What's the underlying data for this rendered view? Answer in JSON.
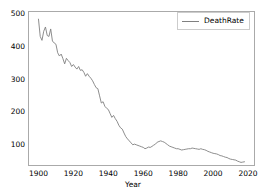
{
  "chart_data": {
    "type": "line",
    "title": "",
    "xlabel": "Year",
    "ylabel": "",
    "xlim": [
      1894,
      2024
    ],
    "ylim": [
      35,
      510
    ],
    "grid": false,
    "legend_position": "upper right",
    "xticks": [
      1900,
      1920,
      1940,
      1960,
      1980,
      2000,
      2020
    ],
    "yticks": [
      100,
      200,
      300,
      400,
      500
    ],
    "series": [
      {
        "name": "DeathRate",
        "color": "#808080",
        "x": [
          1900,
          1901,
          1902,
          1903,
          1904,
          1905,
          1906,
          1907,
          1908,
          1909,
          1910,
          1911,
          1912,
          1913,
          1914,
          1915,
          1916,
          1917,
          1918,
          1919,
          1920,
          1921,
          1922,
          1923,
          1924,
          1925,
          1926,
          1927,
          1928,
          1929,
          1930,
          1931,
          1932,
          1933,
          1934,
          1935,
          1936,
          1937,
          1938,
          1939,
          1940,
          1941,
          1942,
          1943,
          1944,
          1945,
          1946,
          1947,
          1948,
          1949,
          1950,
          1951,
          1952,
          1953,
          1954,
          1955,
          1956,
          1957,
          1958,
          1959,
          1960,
          1961,
          1962,
          1963,
          1964,
          1965,
          1966,
          1967,
          1968,
          1969,
          1970,
          1971,
          1972,
          1973,
          1974,
          1975,
          1976,
          1977,
          1978,
          1979,
          1980,
          1981,
          1982,
          1983,
          1984,
          1985,
          1986,
          1987,
          1988,
          1989,
          1990,
          1991,
          1992,
          1993,
          1994,
          1995,
          1996,
          1997,
          1998,
          1999,
          2000,
          2001,
          2002,
          2003,
          2004,
          2005,
          2006,
          2007,
          2008,
          2009,
          2010,
          2011,
          2012,
          2013,
          2014,
          2015,
          2016,
          2017,
          2018
        ],
        "values": [
          485,
          432,
          420,
          448,
          461,
          435,
          432,
          455,
          418,
          412,
          408,
          382,
          372,
          378,
          364,
          348,
          365,
          358,
          352,
          340,
          346,
          338,
          332,
          340,
          328,
          330,
          322,
          310,
          318,
          310,
          304,
          296,
          285,
          275,
          272,
          250,
          228,
          232,
          218,
          212,
          208,
          196,
          184,
          190,
          180,
          172,
          160,
          152,
          148,
          136,
          125,
          118,
          112,
          106,
          100,
          102,
          100,
          98,
          96,
          94,
          92,
          88,
          90,
          93,
          92,
          95,
          99,
          102,
          108,
          110,
          112,
          110,
          108,
          104,
          100,
          96,
          94,
          92,
          90,
          88,
          88,
          86,
          84,
          85,
          86,
          87,
          88,
          88,
          90,
          89,
          88,
          87,
          86,
          88,
          86,
          85,
          83,
          80,
          78,
          76,
          74,
          73,
          72,
          70,
          67,
          66,
          64,
          62,
          61,
          58,
          56,
          55,
          54,
          53,
          50,
          48,
          46,
          47,
          48
        ]
      }
    ]
  },
  "legend": {
    "entries": [
      {
        "label": "DeathRate"
      }
    ]
  },
  "axes": {
    "xlabel": "Year",
    "xticks": [
      "1900",
      "1920",
      "1940",
      "1960",
      "1980",
      "2000",
      "2020"
    ],
    "yticks": [
      "100",
      "200",
      "300",
      "400",
      "500"
    ]
  }
}
